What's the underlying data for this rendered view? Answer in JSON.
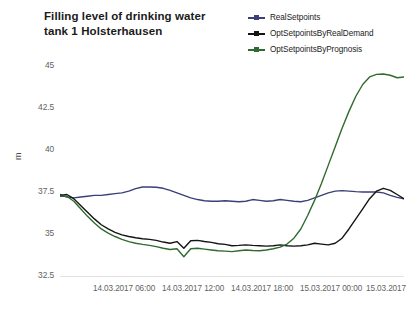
{
  "chart_data": {
    "type": "line",
    "title": "Filling level of drinking water tank 1 Holsterhausen",
    "title_line1": "Filling level of drinking water",
    "title_line2": "tank 1 Holsterhausen",
    "xlabel": "",
    "ylabel": "m",
    "ylim": [
      32.5,
      45
    ],
    "y_ticks": [
      32.5,
      35,
      40,
      42.5,
      45
    ],
    "y_tick_labels": [
      "32.5",
      "35",
      "37.5",
      "40",
      "42.5",
      "45"
    ],
    "y_tick_values": [
      32.5,
      35,
      37.5,
      40,
      42.5,
      45
    ],
    "x_tick_labels": [
      "14.03.2017 06:00",
      "14.03.2017 12:00",
      "14.03.2017 18:00",
      "15.03.2017 00:00",
      "15.03.2017"
    ],
    "x_tick_positions_px": [
      93,
      162,
      231,
      300,
      366
    ],
    "xlim_labels": [
      "14.03.2017 03:00",
      "15.03.2017 09:00"
    ],
    "grid": false,
    "legend_position": "top-right",
    "series": [
      {
        "name": "RealSetpoints",
        "color": "#3c3f78",
        "x": [
          0,
          2,
          4,
          6,
          8,
          10,
          12,
          14,
          16,
          18,
          20,
          22,
          24,
          26,
          28,
          30,
          32,
          34,
          36,
          38,
          40,
          42,
          44,
          46,
          48,
          50,
          52,
          54,
          56,
          58,
          60,
          62,
          64,
          66,
          68,
          70,
          72,
          74,
          76,
          78,
          80,
          82,
          84,
          86,
          88,
          90,
          92,
          94,
          96,
          98,
          100
        ],
        "values": [
          37.35,
          37.2,
          37.15,
          37.2,
          37.25,
          37.3,
          37.3,
          37.35,
          37.4,
          37.45,
          37.55,
          37.7,
          37.8,
          37.8,
          37.78,
          37.72,
          37.6,
          37.45,
          37.3,
          37.15,
          37.05,
          36.98,
          36.95,
          36.95,
          36.98,
          36.95,
          36.92,
          36.95,
          37.05,
          37.0,
          36.95,
          36.98,
          37.05,
          37.0,
          36.95,
          36.92,
          37.0,
          37.15,
          37.3,
          37.45,
          37.55,
          37.58,
          37.55,
          37.52,
          37.5,
          37.5,
          37.5,
          37.45,
          37.3,
          37.18,
          37.1
        ]
      },
      {
        "name": "OptSetpointsByRealDemand",
        "color": "#141414",
        "x": [
          0,
          2,
          4,
          6,
          8,
          10,
          12,
          14,
          16,
          18,
          20,
          22,
          24,
          26,
          28,
          30,
          32,
          34,
          36,
          38,
          40,
          42,
          44,
          46,
          48,
          50,
          52,
          54,
          56,
          58,
          60,
          62,
          64,
          66,
          68,
          70,
          72,
          74,
          76,
          78,
          80,
          82,
          84,
          86,
          88,
          90,
          92,
          94,
          96,
          98,
          100
        ],
        "values": [
          37.3,
          37.35,
          37.1,
          36.7,
          36.3,
          35.9,
          35.55,
          35.3,
          35.1,
          34.95,
          34.85,
          34.78,
          34.72,
          34.68,
          34.62,
          34.52,
          34.45,
          34.55,
          34.15,
          34.6,
          34.62,
          34.55,
          34.5,
          34.42,
          34.38,
          34.3,
          34.32,
          34.35,
          34.32,
          34.3,
          34.28,
          34.3,
          34.35,
          34.3,
          34.28,
          34.3,
          34.35,
          34.45,
          34.4,
          34.35,
          34.45,
          34.75,
          35.3,
          35.9,
          36.5,
          37.1,
          37.55,
          37.72,
          37.6,
          37.35,
          37.1
        ]
      },
      {
        "name": "OptSetpointsByPrognosis",
        "color": "#2f6b2f",
        "x": [
          0,
          2,
          4,
          6,
          8,
          10,
          12,
          14,
          16,
          18,
          20,
          22,
          24,
          26,
          28,
          30,
          32,
          34,
          36,
          38,
          40,
          42,
          44,
          46,
          48,
          50,
          52,
          54,
          56,
          58,
          60,
          62,
          64,
          66,
          68,
          70,
          72,
          74,
          76,
          78,
          80,
          82,
          84,
          86,
          88,
          90,
          92,
          94,
          96,
          98,
          100
        ],
        "values": [
          37.25,
          37.25,
          36.95,
          36.5,
          36.05,
          35.65,
          35.3,
          35.05,
          34.85,
          34.68,
          34.55,
          34.45,
          34.38,
          34.32,
          34.25,
          34.15,
          34.08,
          34.12,
          33.65,
          34.12,
          34.15,
          34.1,
          34.05,
          34.0,
          33.98,
          33.95,
          34.0,
          34.05,
          34.02,
          34.0,
          34.05,
          34.12,
          34.22,
          34.4,
          34.75,
          35.3,
          36.1,
          37.0,
          38.0,
          39.1,
          40.2,
          41.3,
          42.3,
          43.2,
          43.9,
          44.35,
          44.5,
          44.52,
          44.45,
          44.3,
          44.35
        ]
      }
    ]
  },
  "legend": {
    "items": [
      {
        "label": "RealSetpoints",
        "color": "#3c3f78"
      },
      {
        "label": "OptSetpointsByRealDemand",
        "color": "#141414"
      },
      {
        "label": "OptSetpointsByPrognosis",
        "color": "#2f6b2f"
      }
    ]
  },
  "axes": {
    "y_label": "m"
  }
}
